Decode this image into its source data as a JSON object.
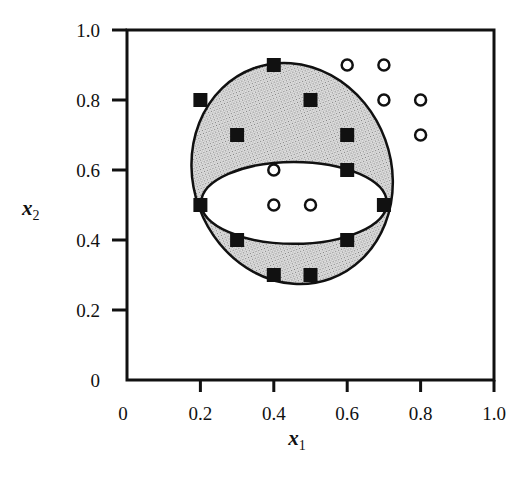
{
  "chart_data": {
    "type": "scatter",
    "title": "",
    "xlabel": "x1",
    "ylabel": "x2",
    "xlabel_main": "x",
    "xlabel_sub": "1",
    "ylabel_main": "x",
    "ylabel_sub": "2",
    "xlim": [
      0,
      1.0
    ],
    "ylim": [
      0,
      1.0
    ],
    "grid": false,
    "legend": "none",
    "x_ticks": [
      "0",
      "0.2",
      "0.4",
      "0.6",
      "0.8",
      "1.0"
    ],
    "y_ticks": [
      "0",
      "0.2",
      "0.4",
      "0.6",
      "0.8",
      "1.0"
    ],
    "series": [
      {
        "name": "class-squares",
        "marker": "filled-square",
        "points": [
          {
            "x": 0.4,
            "y": 0.9
          },
          {
            "x": 0.2,
            "y": 0.8
          },
          {
            "x": 0.5,
            "y": 0.8
          },
          {
            "x": 0.3,
            "y": 0.7
          },
          {
            "x": 0.6,
            "y": 0.7
          },
          {
            "x": 0.6,
            "y": 0.6
          },
          {
            "x": 0.2,
            "y": 0.5
          },
          {
            "x": 0.7,
            "y": 0.5
          },
          {
            "x": 0.3,
            "y": 0.4
          },
          {
            "x": 0.6,
            "y": 0.4
          },
          {
            "x": 0.4,
            "y": 0.3
          },
          {
            "x": 0.5,
            "y": 0.3
          }
        ]
      },
      {
        "name": "class-circles",
        "marker": "open-circle",
        "points": [
          {
            "x": 0.6,
            "y": 0.9
          },
          {
            "x": 0.7,
            "y": 0.9
          },
          {
            "x": 0.7,
            "y": 0.8
          },
          {
            "x": 0.8,
            "y": 0.8
          },
          {
            "x": 0.8,
            "y": 0.7
          },
          {
            "x": 0.4,
            "y": 0.6
          },
          {
            "x": 0.4,
            "y": 0.5
          },
          {
            "x": 0.5,
            "y": 0.5
          }
        ]
      }
    ],
    "regions": [
      {
        "name": "outer-ellipse",
        "shape": "ellipse",
        "fill": "stippled-gray",
        "cx": 0.45,
        "cy": 0.59,
        "rx": 0.27,
        "ry": 0.32,
        "rotation_deg": -20
      },
      {
        "name": "inner-ellipse",
        "shape": "ellipse",
        "fill": "white",
        "cx": 0.455,
        "cy": 0.506,
        "rx": 0.253,
        "ry": 0.117,
        "rotation_deg": 0
      }
    ],
    "annotations": []
  }
}
